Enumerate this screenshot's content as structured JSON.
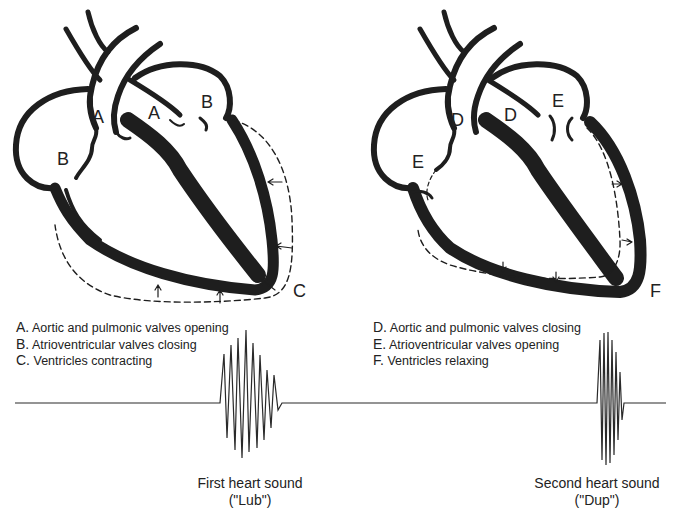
{
  "left_heart": {
    "labels": {
      "A1": "A",
      "A2": "A",
      "B1": "B",
      "B2": "B",
      "C": "C"
    }
  },
  "right_heart": {
    "labels": {
      "D1": "D",
      "D2": "D",
      "E1": "E",
      "E2": "E",
      "F": "F"
    }
  },
  "legend_left": [
    {
      "key": "A.",
      "text": "Aortic and pulmonic valves opening"
    },
    {
      "key": "B.",
      "text": "Atrioventricular valves closing"
    },
    {
      "key": "C.",
      "text": "Ventricles contracting"
    }
  ],
  "legend_right": [
    {
      "key": "D.",
      "text": "Aortic and pulmonic valves closing"
    },
    {
      "key": "E.",
      "text": "Atrioventricular valves opening"
    },
    {
      "key": "F.",
      "text": "Ventricles relaxing"
    }
  ],
  "captions": {
    "first": {
      "line1": "First heart sound",
      "line2": "(\"Lub\")"
    },
    "second": {
      "line1": "Second heart sound",
      "line2": "(\"Dup\")"
    }
  },
  "colors": {
    "ink": "#1e1e1e",
    "background": "#ffffff"
  }
}
